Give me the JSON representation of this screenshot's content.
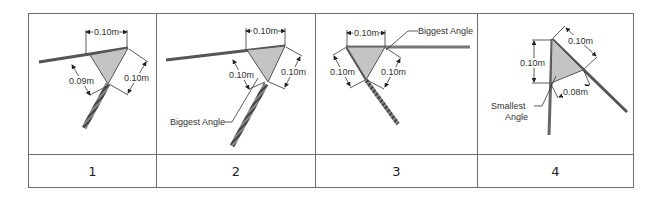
{
  "table": {
    "cells": [
      {
        "number": "1",
        "dims": {
          "top": "0.10m",
          "left": "0.09m",
          "right": "0.10m"
        }
      },
      {
        "number": "2",
        "dims": {
          "top": "0.10m",
          "left": "0.10m",
          "right": "0.10m"
        },
        "callout": "Biggest Angle"
      },
      {
        "number": "3",
        "dims": {
          "top": "0.10m",
          "left": "0.10m",
          "right": "0.10m"
        },
        "callout": "Biggest Angle"
      },
      {
        "number": "4",
        "dims": {
          "top": "0.10m",
          "left": "0.10m",
          "bottom": "0.08m"
        },
        "callout_line1": "Smallest",
        "callout_line2": "Angle"
      }
    ]
  },
  "colors": {
    "border": "#6e6e6e",
    "triangle_fill": "#c4c4c4",
    "beam": "#4a4a4a",
    "dim_line": "#333333"
  }
}
